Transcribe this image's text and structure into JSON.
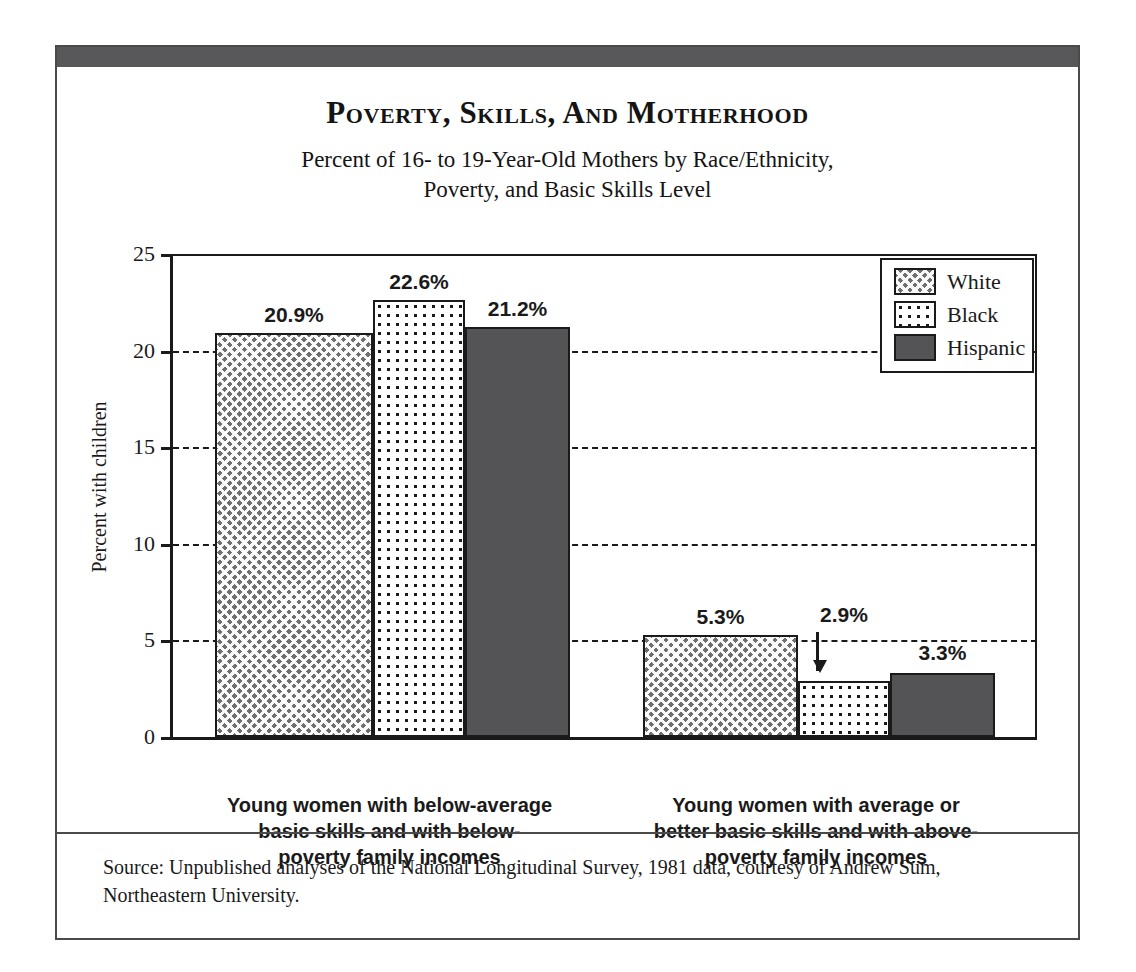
{
  "figure": {
    "title": "Poverty, Skills, and Motherhood",
    "subtitle_line1": "Percent of 16- to 19-Year-Old Mothers by Race/Ethnicity,",
    "subtitle_line2": "Poverty, and Basic Skills Level",
    "source_note": "Source: Unpublished analyses of the National Longitudinal Survey, 1981 data, courtesy of Andrew Sum, Northeastern University.",
    "frame_color": "#58585a"
  },
  "chart_data": {
    "type": "bar",
    "title": "Poverty, Skills, and Motherhood",
    "subtitle": "Percent of 16- to 19-Year-Old Mothers by Race/Ethnicity, Poverty, and Basic Skills Level",
    "xlabel": "",
    "ylabel": "Percent with children",
    "ylim": [
      0,
      25
    ],
    "yticks": [
      0,
      5,
      10,
      15,
      20,
      25
    ],
    "ytick_labels": [
      "0",
      "5",
      "10",
      "15",
      "20",
      "25"
    ],
    "grid": "horizontal-dashed",
    "legend_position": "top-right-inside",
    "categories": [
      "Young women with below-average basic skills and with below-poverty family incomes",
      "Young women with average or better basic skills and with above-poverty family incomes"
    ],
    "category_lines": [
      [
        "Young women with below-average",
        "basic skills and with below-",
        "poverty family incomes"
      ],
      [
        "Young women with average or",
        "better basic skills and with above-",
        "poverty family incomes"
      ]
    ],
    "series": [
      {
        "name": "White",
        "pattern": "cross-hatch",
        "color": "#6f6f70",
        "values": [
          20.9,
          5.3
        ],
        "labels": [
          "20.9%",
          "5.3%"
        ]
      },
      {
        "name": "Black",
        "pattern": "dotted",
        "color": "#ffffff",
        "values": [
          22.6,
          2.9
        ],
        "labels": [
          "22.6%",
          "2.9%"
        ]
      },
      {
        "name": "Hispanic",
        "pattern": "solid",
        "color": "#545457",
        "values": [
          21.2,
          3.3
        ],
        "labels": [
          "21.2%",
          "3.3%"
        ]
      }
    ],
    "annotations": [
      {
        "type": "arrow",
        "text": "2.9%",
        "points_to": "Black bar in group 2",
        "direction": "down"
      }
    ]
  },
  "legend": {
    "items": [
      {
        "label": "White"
      },
      {
        "label": "Black"
      },
      {
        "label": "Hispanic"
      }
    ]
  }
}
